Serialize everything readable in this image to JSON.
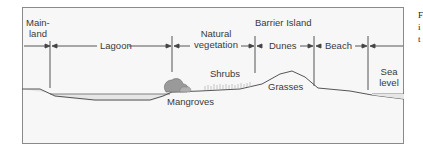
{
  "diagram": {
    "title": "Barrier Island",
    "zones": [
      {
        "label_line1": "Main-",
        "label_line2": "land"
      },
      {
        "label": "Lagoon"
      },
      {
        "label_line1": "Natural",
        "label_line2": "vegetation"
      },
      {
        "label": "Dunes"
      },
      {
        "label": "Beach"
      },
      {
        "label_line1": "Sea",
        "label_line2": "level"
      }
    ],
    "features": {
      "mangroves": "Mangroves",
      "shrubs": "Shrubs",
      "grasses": "Grasses"
    },
    "colors": {
      "frame_border": "#8a8a8a",
      "background": "#f7f7f7",
      "lines": "#555555",
      "water": "#e2e2e2",
      "mangrove": "#9a9a9a"
    }
  },
  "side_text": [
    "F",
    "i",
    "t"
  ]
}
